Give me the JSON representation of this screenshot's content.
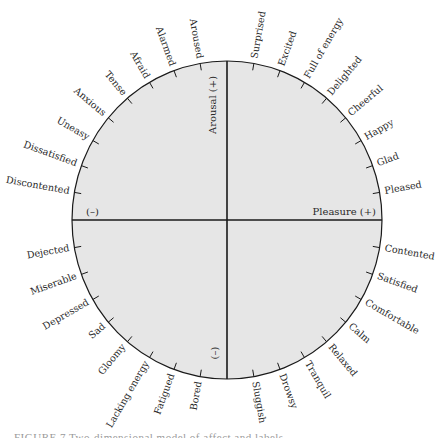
{
  "diagram": {
    "center": {
      "x": 227,
      "y": 220
    },
    "radius": {
      "rx": 155,
      "ry": 159
    },
    "colors": {
      "fill": "#e6e6e6",
      "stroke": "#1a1a1a",
      "text": "#2a2a2a"
    },
    "axes": {
      "pleasure_positive": "Pleasure (+)",
      "pleasure_negative": "(–)",
      "arousal_positive": "Arousal (+)",
      "arousal_negative": "(–)"
    },
    "emotions": [
      {
        "label": "Pleased",
        "angle": 10
      },
      {
        "label": "Glad",
        "angle": 20
      },
      {
        "label": "Happy",
        "angle": 30
      },
      {
        "label": "Cheerful",
        "angle": 40
      },
      {
        "label": "Delighted",
        "angle": 50
      },
      {
        "label": "Full of energy",
        "angle": 60
      },
      {
        "label": "Excited",
        "angle": 70
      },
      {
        "label": "Surprised",
        "angle": 80
      },
      {
        "label": "Aroused",
        "angle": 100
      },
      {
        "label": "Alarmed",
        "angle": 110
      },
      {
        "label": "Afraid",
        "angle": 120
      },
      {
        "label": "Tense",
        "angle": 130
      },
      {
        "label": "Anxious",
        "angle": 140
      },
      {
        "label": "Uneasy",
        "angle": 150
      },
      {
        "label": "Dissatisfied",
        "angle": 160
      },
      {
        "label": "Discontented",
        "angle": 170
      },
      {
        "label": "Dejected",
        "angle": 190
      },
      {
        "label": "Miserable",
        "angle": 200
      },
      {
        "label": "Depressed",
        "angle": 210
      },
      {
        "label": "Sad",
        "angle": 220
      },
      {
        "label": "Gloomy",
        "angle": 230
      },
      {
        "label": "Lacking energy",
        "angle": 240
      },
      {
        "label": "Fatigued",
        "angle": 250
      },
      {
        "label": "Bored",
        "angle": 260
      },
      {
        "label": "Sluggish",
        "angle": 280
      },
      {
        "label": "Drowsy",
        "angle": 290
      },
      {
        "label": "Tranquil",
        "angle": 300
      },
      {
        "label": "Relaxed",
        "angle": 310
      },
      {
        "label": "Calm",
        "angle": 320
      },
      {
        "label": "Comfortable",
        "angle": 330
      },
      {
        "label": "Satisfied",
        "angle": 340
      },
      {
        "label": "Contented",
        "angle": 350
      }
    ]
  },
  "caption": "FIGURE 7  Two-dimensional model of affect and labels"
}
